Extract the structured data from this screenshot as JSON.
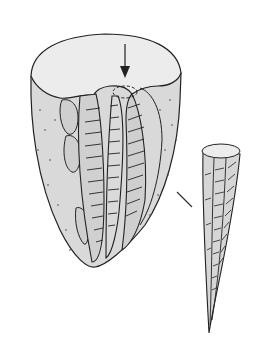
{
  "figure": {
    "colors": {
      "background": "#ffffff",
      "top_face": "#ebebeb",
      "body_fill": "#d9d9d9",
      "ridge_fill": "#cfcfcf",
      "stroke": "#222222"
    },
    "elements": {
      "large_specimen": "large-cone-specimen",
      "arrow": "down-arrow",
      "dashed_circle": "dashed-circle-marker",
      "connector_line": "connector-line",
      "small_specimen": "small-spike-specimen"
    }
  }
}
